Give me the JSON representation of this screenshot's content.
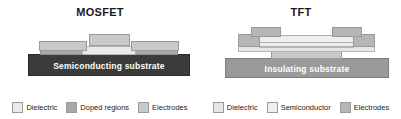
{
  "figure": {
    "background": "#ffffff",
    "panels": [
      {
        "id": "mosfet",
        "title": "MOSFET",
        "substrate": {
          "label": "Semiconducting substrate",
          "color": "#3b3b3b",
          "text_color": "#ffffff"
        },
        "layers": [
          {
            "name": "source-doped-region",
            "type": "doped",
            "color": "#a8a8a8"
          },
          {
            "name": "drain-doped-region",
            "type": "doped",
            "color": "#a8a8a8"
          },
          {
            "name": "gate-dielectric",
            "type": "dielectric",
            "color": "#eaeaea"
          },
          {
            "name": "source-electrode",
            "type": "electrode",
            "color": "#c9c9c9"
          },
          {
            "name": "gate-electrode",
            "type": "electrode",
            "color": "#c9c9c9"
          },
          {
            "name": "drain-electrode",
            "type": "electrode",
            "color": "#c9c9c9"
          }
        ],
        "legend": [
          {
            "label": "Dielectric",
            "color": "#eaeaea"
          },
          {
            "label": "Doped regions",
            "color": "#a8a8a8"
          },
          {
            "label": "Electrodes",
            "color": "#c9c9c9"
          }
        ]
      },
      {
        "id": "tft",
        "title": "TFT",
        "substrate": {
          "label": "Insulating substrate",
          "color": "#9a9a9a",
          "text_color": "#ffffff"
        },
        "layers": [
          {
            "name": "gate-electrode",
            "type": "electrode",
            "color": "#c9c9c9"
          },
          {
            "name": "gate-dielectric",
            "type": "dielectric",
            "color": "#e6e6e6"
          },
          {
            "name": "semiconductor-layer",
            "type": "semiconductor",
            "color": "#efefef"
          },
          {
            "name": "source-electrode",
            "type": "electrode",
            "color": "#b6b6b6"
          },
          {
            "name": "drain-electrode",
            "type": "electrode",
            "color": "#b6b6b6"
          }
        ],
        "legend": [
          {
            "label": "Dielectric",
            "color": "#e6e6e6"
          },
          {
            "label": "Semiconductor",
            "color": "#efefef"
          },
          {
            "label": "Electrodes",
            "color": "#b6b6b6"
          }
        ]
      }
    ]
  }
}
